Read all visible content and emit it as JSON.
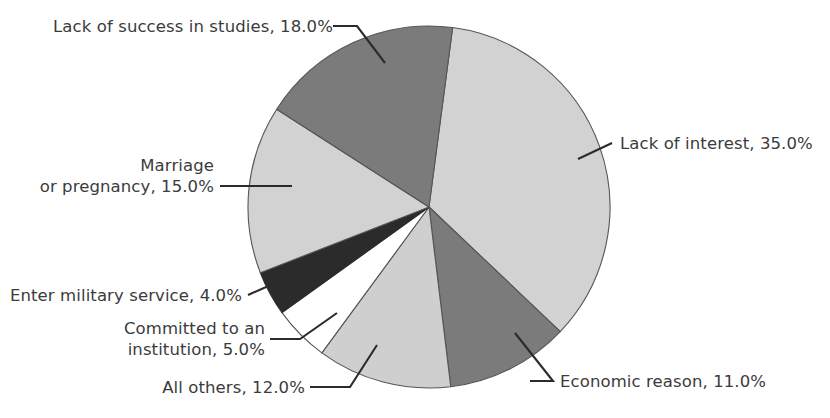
{
  "chart_data": {
    "type": "pie",
    "title": "",
    "subtitle": "",
    "xlabel": "",
    "ylabel": "",
    "legend_position": "none",
    "grid": false,
    "value_unit": "percent",
    "start_angle_deg": 7.5,
    "direction": "clockwise",
    "categories": [
      "Lack of interest",
      "Economic reason",
      "All others",
      "Committed to an institution",
      "Enter military service",
      "Marriage or pregnancy",
      "Lack of success in studies"
    ],
    "values": [
      35.0,
      11.0,
      12.0,
      5.0,
      4.0,
      15.0,
      18.0
    ],
    "slices": [
      {
        "id": "lack-of-interest",
        "label": "Lack of interest, 35.0%",
        "label_lines": [
          "Lack of interest, 35.0%"
        ],
        "value": 35.0,
        "value_text": "35.0%",
        "name": "Lack of interest",
        "color": "#d2d2d2",
        "stroke": "#555555"
      },
      {
        "id": "economic-reason",
        "label": "Economic reason, 11.0%",
        "label_lines": [
          "Economic reason, 11.0%"
        ],
        "value": 11.0,
        "value_text": "11.0%",
        "name": "Economic reason",
        "color": "#7b7b7b",
        "stroke": "#555555"
      },
      {
        "id": "all-others",
        "label": "All others, 12.0%",
        "label_lines": [
          "All others, 12.0%"
        ],
        "value": 12.0,
        "value_text": "12.0%",
        "name": "All others",
        "color": "#cfcfcf",
        "stroke": "#555555"
      },
      {
        "id": "committed-to-an-institution",
        "label": "Committed to an institution, 5.0%",
        "label_lines": [
          "Committed to an",
          "institution, 5.0%"
        ],
        "value": 5.0,
        "value_text": "5.0%",
        "name": "Committed to an institution",
        "color": "#ffffff",
        "stroke": "#555555"
      },
      {
        "id": "enter-military-service",
        "label": "Enter military service, 4.0%",
        "label_lines": [
          "Enter military service, 4.0%"
        ],
        "value": 4.0,
        "value_text": "4.0%",
        "name": "Enter military service",
        "color": "#2b2b2b",
        "stroke": "#2b2b2b"
      },
      {
        "id": "marriage-or-pregnancy",
        "label": "Marriage or pregnancy, 15.0%",
        "label_lines": [
          "Marriage",
          "or pregnancy, 15.0%"
        ],
        "value": 15.0,
        "value_text": "15.0%",
        "name": "Marriage or pregnancy",
        "color": "#d2d2d2",
        "stroke": "#555555"
      },
      {
        "id": "lack-of-success-in-studies",
        "label": "Lack of success in studies, 18.0%",
        "label_lines": [
          "Lack of success in studies, 18.0%"
        ],
        "value": 18.0,
        "value_text": "18.0%",
        "name": "Lack of success in studies",
        "color": "#7b7b7b",
        "stroke": "#555555"
      }
    ],
    "total": 100.0
  },
  "labels": {
    "lack_of_success": {
      "line1": "Lack of success in studies, 18.0%"
    },
    "marriage": {
      "line1": "Marriage",
      "line2": "or pregnancy, 15.0%"
    },
    "military": {
      "line1": "Enter military service, 4.0%"
    },
    "committed": {
      "line1": "Committed to an",
      "line2": "institution, 5.0%"
    },
    "all_others": {
      "line1": "All others, 12.0%"
    },
    "economic": {
      "line1": "Economic reason, 11.0%"
    },
    "lack_of_interest": {
      "line1": "Lack of interest, 35.0%"
    }
  }
}
